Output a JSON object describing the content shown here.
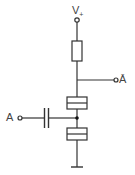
{
  "diagram": {
    "type": "circuit-schematic",
    "labels": {
      "supply": "V",
      "supply_sub": "+",
      "input": "A",
      "output": "Ā"
    },
    "components": [
      {
        "id": "R1",
        "kind": "resistor",
        "position": "between V+ and output node"
      },
      {
        "id": "X1",
        "kind": "crystal/piezo element",
        "position": "between output node and input node"
      },
      {
        "id": "C1",
        "kind": "capacitor",
        "position": "between input terminal A and input node"
      },
      {
        "id": "X2",
        "kind": "crystal/piezo element",
        "position": "between input node and ground"
      },
      {
        "id": "GND",
        "kind": "ground"
      }
    ],
    "colors": {
      "stroke": "#333333",
      "background": "#ffffff"
    }
  }
}
